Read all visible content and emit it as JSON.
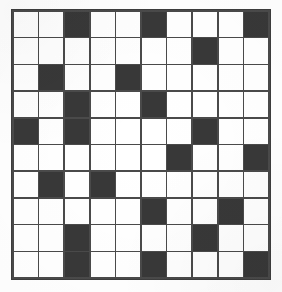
{
  "figure": {
    "type": "grid-pattern",
    "rows": 10,
    "columns": 10,
    "background_color": "#ffffff",
    "filled_cell_color": "#383838",
    "empty_cell_color": "#ffffff",
    "gridline_color": "#4a4a4a",
    "border_color": "#3d3d3d",
    "canvas_width": 282,
    "canvas_height": 292
  },
  "grid": {
    "legend": {
      "filled": "filled-square",
      "empty": "empty-square"
    },
    "filled_cells_by_row": {
      "1": [
        3,
        6,
        10
      ],
      "2": [
        8
      ],
      "3": [
        2,
        5
      ],
      "4": [
        3,
        6
      ],
      "5": [
        1,
        3,
        8
      ],
      "6": [
        7,
        10
      ],
      "7": [
        2,
        4
      ],
      "8": [
        6,
        9
      ],
      "9": [
        3,
        8
      ],
      "10": [
        3,
        6,
        10
      ]
    },
    "matrix": [
      [
        0,
        0,
        1,
        0,
        0,
        1,
        0,
        0,
        0,
        1
      ],
      [
        0,
        0,
        0,
        0,
        0,
        0,
        0,
        1,
        0,
        0
      ],
      [
        0,
        1,
        0,
        0,
        1,
        0,
        0,
        0,
        0,
        0
      ],
      [
        0,
        0,
        1,
        0,
        0,
        1,
        0,
        0,
        0,
        0
      ],
      [
        1,
        0,
        1,
        0,
        0,
        0,
        0,
        1,
        0,
        0
      ],
      [
        0,
        0,
        0,
        0,
        0,
        0,
        1,
        0,
        0,
        1
      ],
      [
        0,
        1,
        0,
        1,
        0,
        0,
        0,
        0,
        0,
        0
      ],
      [
        0,
        0,
        0,
        0,
        0,
        1,
        0,
        0,
        1,
        0
      ],
      [
        0,
        0,
        1,
        0,
        0,
        0,
        0,
        1,
        0,
        0
      ],
      [
        0,
        0,
        1,
        0,
        0,
        1,
        0,
        0,
        0,
        1
      ]
    ],
    "total_cells": 100,
    "filled_count": 21,
    "empty_count": 79
  }
}
